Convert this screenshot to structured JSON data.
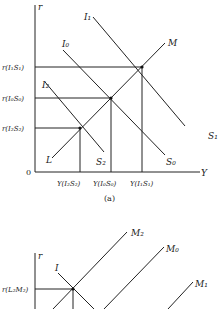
{
  "panel_a": {
    "caption": "(a)",
    "axis_y_label": "r",
    "axis_x_label": "Y",
    "origin_label": "0",
    "curves": {
      "I1": "I₁",
      "I0": "I₀",
      "I2": "I₂",
      "S1": "S₁",
      "S0": "S₀",
      "S2": "S₂",
      "M": "M",
      "L": "L"
    },
    "y_labels": {
      "r_I1S1": "r(I₁S₁)",
      "r_I0S0": "r(I₀S₀)",
      "r_I2S2": "r(I₂S₂)"
    },
    "x_labels": {
      "Y_I2S2": "Y(I₂S₂)",
      "Y_I0S0": "Y(I₀S₀)",
      "Y_I1S1": "Y(I₁S₁)"
    }
  },
  "panel_b": {
    "axis_y_label": "r",
    "curves": {
      "I": "I",
      "M2": "M₂",
      "M0": "M₀",
      "M1": "M₁"
    },
    "y_labels": {
      "r_L2M2": "r(L₂M₂)"
    }
  }
}
